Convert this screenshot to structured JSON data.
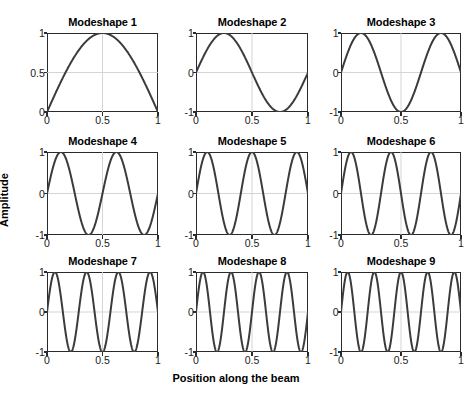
{
  "figure": {
    "xlabel": "Position along the beam",
    "ylabel": "Amplitude",
    "line_color": "#3b3b3b",
    "axis_color": "#2a2a2a",
    "grid_color": "#d0d0d0",
    "background": "#ffffff"
  },
  "chart_data": {
    "type": "line",
    "title": "",
    "xlabel": "Position along the beam",
    "ylabel": "Amplitude",
    "grid": true,
    "legend": null,
    "layout": {
      "rows": 3,
      "cols": 3
    },
    "subplots": [
      {
        "title": "Modeshape 1",
        "index": 1,
        "formula": "sin(1*pi*x)",
        "half_waves": 1,
        "xlim": [
          0,
          1
        ],
        "ylim": [
          0,
          1
        ],
        "xticks": [
          0,
          0.5,
          1
        ],
        "xticklabels": [
          "0",
          "0.5",
          "1"
        ],
        "yticks": [
          0,
          0.5,
          1
        ],
        "yticklabels": [
          "0",
          "0.5",
          "1"
        ],
        "x": [
          0,
          0.05,
          0.1,
          0.15,
          0.2,
          0.25,
          0.3,
          0.35,
          0.4,
          0.45,
          0.5,
          0.55,
          0.6,
          0.65,
          0.7,
          0.75,
          0.8,
          0.85,
          0.9,
          0.95,
          1
        ],
        "y": [
          0,
          0.156,
          0.309,
          0.454,
          0.588,
          0.707,
          0.809,
          0.891,
          0.951,
          0.988,
          1,
          0.988,
          0.951,
          0.891,
          0.809,
          0.707,
          0.588,
          0.454,
          0.309,
          0.156,
          0
        ]
      },
      {
        "title": "Modeshape 2",
        "index": 2,
        "formula": "sin(2*pi*x)",
        "half_waves": 2,
        "xlim": [
          0,
          1
        ],
        "ylim": [
          -1,
          1
        ],
        "xticks": [
          0,
          0.5,
          1
        ],
        "xticklabels": [
          "0",
          "0.5",
          "1"
        ],
        "yticks": [
          -1,
          0,
          1
        ],
        "yticklabels": [
          "-1",
          "0",
          "1"
        ],
        "x": [
          0,
          0.0625,
          0.125,
          0.1875,
          0.25,
          0.3125,
          0.375,
          0.4375,
          0.5,
          0.5625,
          0.625,
          0.6875,
          0.75,
          0.8125,
          0.875,
          0.9375,
          1
        ],
        "y": [
          0,
          0.383,
          0.707,
          0.924,
          1,
          0.924,
          0.707,
          0.383,
          0,
          -0.383,
          -0.707,
          -0.924,
          -1,
          -0.924,
          -0.707,
          -0.383,
          0
        ]
      },
      {
        "title": "Modeshape 3",
        "index": 3,
        "formula": "sin(3*pi*x)",
        "half_waves": 3,
        "xlim": [
          0,
          1
        ],
        "ylim": [
          -1,
          1
        ],
        "xticks": [
          0,
          0.5,
          1
        ],
        "xticklabels": [
          "0",
          "0.5",
          "1"
        ],
        "yticks": [
          -1,
          0,
          1
        ],
        "yticklabels": [
          "-1",
          "0",
          "1"
        ],
        "peaks_x": [
          0.167,
          0.833
        ],
        "troughs_x": [
          0.5
        ]
      },
      {
        "title": "Modeshape 4",
        "index": 4,
        "formula": "sin(4*pi*x)",
        "half_waves": 4,
        "xlim": [
          0,
          1
        ],
        "ylim": [
          -1,
          1
        ],
        "xticks": [
          0,
          0.5,
          1
        ],
        "xticklabels": [
          "0",
          "0.5",
          "1"
        ],
        "yticks": [
          -1,
          0,
          1
        ],
        "yticklabels": [
          "-1",
          "0",
          "1"
        ],
        "peaks_x": [
          0.125,
          0.625
        ],
        "troughs_x": [
          0.375,
          0.875
        ]
      },
      {
        "title": "Modeshape 5",
        "index": 5,
        "formula": "sin(5*pi*x)",
        "half_waves": 5,
        "xlim": [
          0,
          1
        ],
        "ylim": [
          -1,
          1
        ],
        "xticks": [
          0,
          0.5,
          1
        ],
        "xticklabels": [
          "0",
          "0.5",
          "1"
        ],
        "yticks": [
          -1,
          0,
          1
        ],
        "yticklabels": [
          "-1",
          "0",
          "1"
        ],
        "peaks_x": [
          0.1,
          0.5,
          0.9
        ],
        "troughs_x": [
          0.3,
          0.7
        ]
      },
      {
        "title": "Modeshape 6",
        "index": 6,
        "formula": "sin(6*pi*x)",
        "half_waves": 6,
        "xlim": [
          0,
          1
        ],
        "ylim": [
          -1,
          1
        ],
        "xticks": [
          0,
          0.5,
          1
        ],
        "xticklabels": [
          "0",
          "0.5",
          "1"
        ],
        "yticks": [
          -1,
          0,
          1
        ],
        "yticklabels": [
          "-1",
          "0",
          "1"
        ],
        "peaks_x": [
          0.083,
          0.417,
          0.75
        ],
        "troughs_x": [
          0.25,
          0.583,
          0.917
        ]
      },
      {
        "title": "Modeshape 7",
        "index": 7,
        "formula": "sin(7*pi*x)",
        "half_waves": 7,
        "xlim": [
          0,
          1
        ],
        "ylim": [
          -1,
          1
        ],
        "xticks": [
          0,
          0.5,
          1
        ],
        "xticklabels": [
          "0",
          "0.5",
          "1"
        ],
        "yticks": [
          -1,
          0,
          1
        ],
        "yticklabels": [
          "-1",
          "0",
          "1"
        ],
        "peaks_x": [
          0.071,
          0.357,
          0.643,
          0.929
        ],
        "troughs_x": [
          0.214,
          0.5,
          0.786
        ]
      },
      {
        "title": "Modeshape 8",
        "index": 8,
        "formula": "sin(8*pi*x)",
        "half_waves": 8,
        "xlim": [
          0,
          1
        ],
        "ylim": [
          -1,
          1
        ],
        "xticks": [
          0,
          0.5,
          1
        ],
        "xticklabels": [
          "0",
          "0.5",
          "1"
        ],
        "yticks": [
          -1,
          0,
          1
        ],
        "yticklabels": [
          "-1",
          "0",
          "1"
        ],
        "peaks_x": [
          0.0625,
          0.3125,
          0.5625,
          0.8125
        ],
        "troughs_x": [
          0.1875,
          0.4375,
          0.6875,
          0.9375
        ]
      },
      {
        "title": "Modeshape 9",
        "index": 9,
        "formula": "sin(9*pi*x)",
        "half_waves": 9,
        "xlim": [
          0,
          1
        ],
        "ylim": [
          -1,
          1
        ],
        "xticks": [
          0,
          0.5,
          1
        ],
        "xticklabels": [
          "0",
          "0.5",
          "1"
        ],
        "yticks": [
          -1,
          0,
          1
        ],
        "yticklabels": [
          "-1",
          "0",
          "1"
        ],
        "peaks_x": [
          0.056,
          0.278,
          0.5,
          0.722,
          0.944
        ],
        "troughs_x": [
          0.167,
          0.389,
          0.611,
          0.833
        ]
      }
    ]
  }
}
